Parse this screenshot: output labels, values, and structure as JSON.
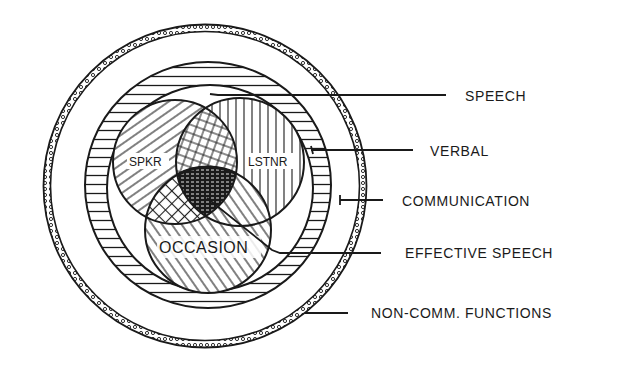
{
  "diagram": {
    "type": "nested-venn",
    "colors": {
      "ink": "#1a1a1a",
      "background": "#ffffff"
    },
    "inner_labels": {
      "speaker": "SPKR",
      "listener": "LSTNR",
      "occasion": "OCCASION"
    },
    "callouts": {
      "speech": "SPEECH",
      "verbal": "VERBAL",
      "communication": "COMMUNICATION",
      "effective_speech": "EFFECTIVE SPEECH",
      "non_comm_functions": "NON-COMM. FUNCTIONS"
    },
    "layers": [
      "NON-COMM. FUNCTIONS (outer double ring)",
      "COMMUNICATION (horizontal-stripe band)",
      "VERBAL (white ring)",
      "SPEECH (overlapping circles SPKR, LSTNR, OCCASION)",
      "EFFECTIVE SPEECH (triple-overlap center)"
    ]
  }
}
